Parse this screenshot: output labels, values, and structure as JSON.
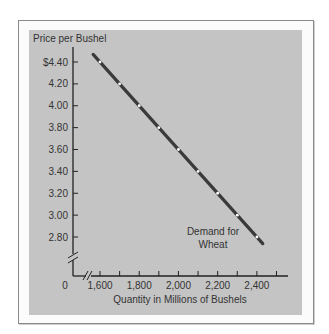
{
  "chart_data": {
    "type": "line",
    "title": "",
    "ylabel": "Price per Bushel",
    "xlabel": "Quantity in Millions of Bushels",
    "origin_label": "0",
    "y_ticks": [
      "$4.40",
      "4.20",
      "4.00",
      "3.80",
      "3.60",
      "3.40",
      "3.20",
      "3.00",
      "2.80"
    ],
    "y_tick_values": [
      4.4,
      4.2,
      4.0,
      3.8,
      3.6,
      3.4,
      3.2,
      3.0,
      2.8
    ],
    "x_tick_labels": [
      "1,600",
      "1,800",
      "2,000",
      "2,200",
      "2,400"
    ],
    "x_tick_values": [
      1600,
      1700,
      1800,
      1900,
      2000,
      2100,
      2200,
      2300,
      2400,
      2500
    ],
    "xlim": [
      1600,
      2500
    ],
    "ylim": [
      2.8,
      4.4
    ],
    "axis_breaks": {
      "x": true,
      "y": true
    },
    "grid": false,
    "series": [
      {
        "name": "Demand for Wheat",
        "x": [
          1600,
          1700,
          1800,
          1900,
          2000,
          2100,
          2200,
          2300,
          2400
        ],
        "y": [
          4.4,
          4.2,
          4.0,
          3.8,
          3.6,
          3.4,
          3.2,
          3.0,
          2.8
        ]
      }
    ],
    "annotations": [
      {
        "text_line1": "Demand for",
        "text_line2": "Wheat"
      }
    ]
  },
  "colors": {
    "panel": "#c4c4c4",
    "line": "#3a3a3a",
    "marker": "#ffffff",
    "axis": "#222222"
  }
}
